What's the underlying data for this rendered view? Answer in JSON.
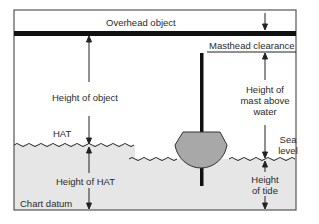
{
  "diagram": {
    "labels": {
      "overhead_object": "Overhead object",
      "height_of_object": "Height of object",
      "masthead_clearance": "Masthead clearance",
      "height_of_mast_line1": "Height of",
      "height_of_mast_line2": "mast above",
      "height_of_mast_line3": "water",
      "hat": "HAT",
      "sea_level_line1": "Sea",
      "sea_level_line2": "level",
      "height_of_hat": "Height of HAT",
      "chart_datum": "Chart datum",
      "height_of_tide_line1": "Height",
      "height_of_tide_line2": "of tide"
    },
    "colors": {
      "water": "#e6e6e6",
      "boat": "#a8a8a8",
      "line": "#1a1a1a",
      "frame": "#555555"
    }
  }
}
